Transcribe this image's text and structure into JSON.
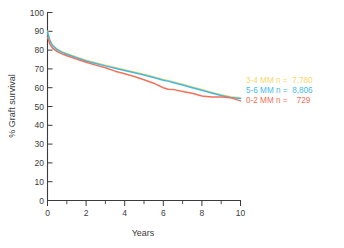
{
  "figure": {
    "background_color": "#ececed",
    "plot_background_color": "#ffffff"
  },
  "axes": {
    "y_title": "% Graft survival",
    "x_title": "Years",
    "y_ticks": [
      "0",
      "10",
      "20",
      "30",
      "40",
      "50",
      "60",
      "70",
      "80",
      "90",
      "100"
    ],
    "x_ticks": [
      "0",
      "2",
      "4",
      "6",
      "8",
      "10"
    ],
    "axis_color": "#3b3b3b"
  },
  "legend": {
    "rows": [
      {
        "label": "3-4 MM n =  7,780",
        "color": "#f5d76e"
      },
      {
        "label": "5-6 MM n =  8,806",
        "color": "#3fb9e8"
      },
      {
        "label": "0-2 MM n =    729",
        "color": "#f2705a"
      }
    ]
  },
  "chart_data": {
    "type": "line",
    "title": "",
    "subtitle": "",
    "xlabel": "Years",
    "ylabel": "% Graft survival",
    "xlim": [
      0,
      10
    ],
    "ylim": [
      0,
      100
    ],
    "x_ticks": [
      0,
      1,
      2,
      3,
      4,
      5,
      6,
      7,
      8,
      9,
      10
    ],
    "x_major_ticks": [
      0,
      2,
      4,
      6,
      8,
      10
    ],
    "y_ticks": [
      0,
      10,
      20,
      30,
      40,
      50,
      60,
      70,
      80,
      90,
      100
    ],
    "grid": false,
    "legend_position": "right-middle",
    "x": [
      0,
      0.12,
      0.25,
      0.5,
      0.75,
      1,
      1.5,
      2,
      2.5,
      3,
      3.5,
      4,
      4.5,
      5,
      5.5,
      6,
      6.25,
      6.5,
      7,
      7.5,
      8,
      8.5,
      9,
      9.5,
      10
    ],
    "series": [
      {
        "name": "3-4 MM n =  7,780",
        "color": "#f5d76e",
        "n": 7780,
        "values": [
          90.0,
          85.5,
          83.0,
          80.6,
          79.2,
          78.2,
          76.3,
          74.6,
          73.3,
          72.0,
          70.8,
          69.6,
          68.4,
          67.1,
          65.8,
          64.4,
          63.9,
          63.2,
          61.8,
          60.4,
          59.0,
          57.6,
          56.3,
          55.2,
          54.6
        ]
      },
      {
        "name": "5-6 MM n =  8,806",
        "color": "#3fb9e8",
        "n": 8806,
        "values": [
          89.6,
          85.0,
          82.5,
          80.2,
          78.8,
          77.8,
          75.9,
          74.2,
          72.9,
          71.6,
          70.4,
          69.2,
          68.0,
          66.7,
          65.4,
          64.0,
          63.5,
          62.8,
          61.4,
          60.0,
          58.6,
          57.2,
          55.9,
          54.8,
          54.2
        ]
      },
      {
        "name": "0-2 MM n =    729",
        "color": "#f2705a",
        "n": 729,
        "values": [
          87.0,
          83.2,
          81.2,
          79.2,
          78.0,
          77.0,
          75.2,
          73.5,
          72.0,
          70.6,
          68.8,
          67.4,
          66.0,
          64.2,
          62.4,
          60.0,
          59.2,
          59.1,
          58.0,
          57.0,
          55.6,
          55.0,
          55.0,
          54.6,
          53.0
        ]
      }
    ]
  }
}
